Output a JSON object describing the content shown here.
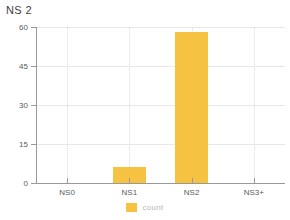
{
  "chart_data": {
    "type": "bar",
    "title": "NS 2",
    "xlabel": "",
    "ylabel": "",
    "categories": [
      "NS0",
      "NS1",
      "NS2",
      "NS3+"
    ],
    "values": [
      0,
      6,
      58,
      0
    ],
    "series": [
      {
        "name": "count",
        "values": [
          0,
          6,
          58,
          0
        ]
      }
    ],
    "ylim": [
      0,
      60
    ],
    "yticks": [
      0,
      15,
      30,
      45,
      60
    ],
    "ytick_labels": [
      "0",
      "15",
      "30",
      "45",
      "60"
    ],
    "grid": {
      "horizontal": true,
      "vertical": true
    },
    "legend": {
      "position": "bottom",
      "entries": [
        "count"
      ]
    },
    "colors": {
      "bar": "#f5c242",
      "legend_swatch": "#f5c242",
      "legend_text": "#b8b8b8",
      "axis": "#999999",
      "gridline_horizontal": "#e8e8e8",
      "gridline_vertical": "#dcdcdc",
      "title_text": "#3f3f3f",
      "tick_text": "#5a5a5a",
      "background": "#ffffff"
    }
  }
}
